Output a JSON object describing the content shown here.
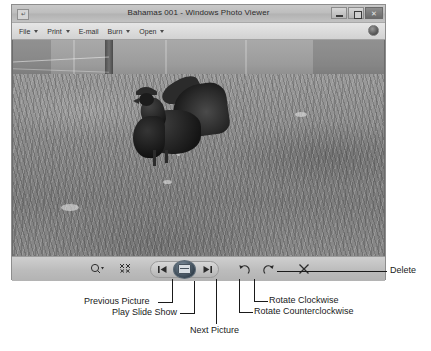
{
  "window": {
    "title": "Bahamas 001 - Windows Photo Viewer",
    "icon_glyph": "↵",
    "controls": [
      {
        "name": "minimize",
        "label": "–"
      },
      {
        "name": "maximize",
        "label": "□"
      },
      {
        "name": "close",
        "label": "✕"
      }
    ]
  },
  "menu": {
    "items": [
      {
        "label": "File",
        "has_caret": true
      },
      {
        "label": "Print",
        "has_caret": true
      },
      {
        "label": "E-mail",
        "has_caret": false
      },
      {
        "label": "Burn",
        "has_caret": true
      },
      {
        "label": "Open",
        "has_caret": true
      }
    ],
    "help_icon": "help-icon"
  },
  "toolbar": {
    "zoom_label": "🔍",
    "zoom_caret": "▾",
    "fit_label": "⤢",
    "previous_label": "⏮",
    "play_label": "play-slideshow-icon",
    "next_label": "⏭",
    "rotate_ccw_label": "↺",
    "rotate_cw_label": "↻",
    "delete_label": "✕"
  },
  "photo": {
    "alt": "Black rooster standing in a grassy yard in front of a concrete wall"
  },
  "annotations": [
    {
      "id": "previous-picture",
      "text": "Previous Picture"
    },
    {
      "id": "play-slide-show",
      "text": "Play Slide Show"
    },
    {
      "id": "next-picture",
      "text": "Next Picture"
    },
    {
      "id": "rotate-counterclockwise",
      "text": "Rotate Counterclockwise"
    },
    {
      "id": "rotate-clockwise",
      "text": "Rotate Clockwise"
    },
    {
      "id": "delete",
      "text": "Delete"
    }
  ]
}
